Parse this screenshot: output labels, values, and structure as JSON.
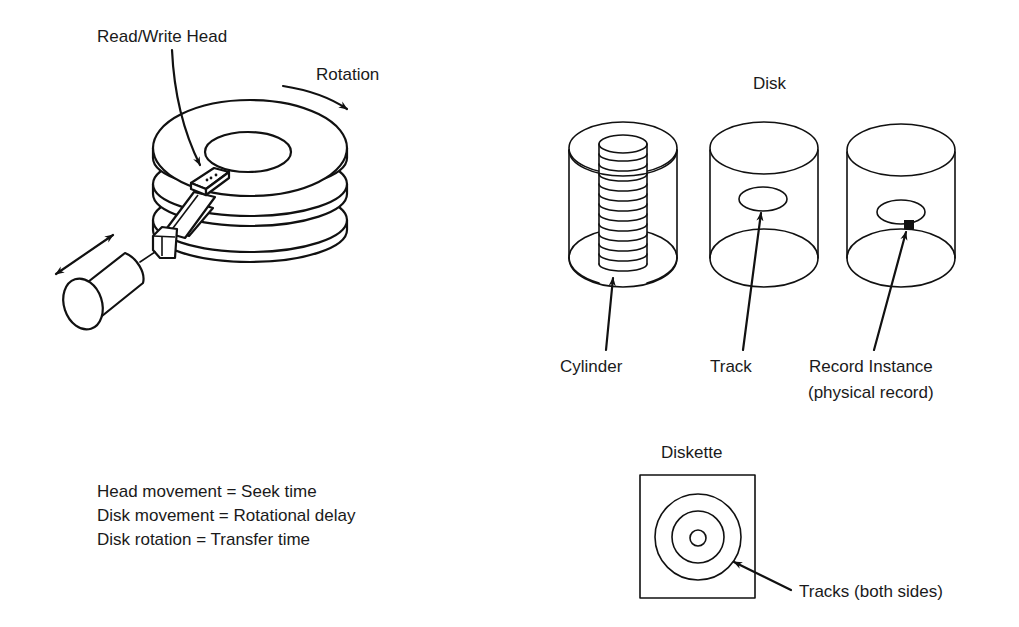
{
  "diagram": {
    "disk_drive": {
      "read_write_head_label": "Read/Write Head",
      "rotation_label": "Rotation"
    },
    "disk": {
      "title": "Disk",
      "parts": [
        {
          "label": "Cylinder"
        },
        {
          "label": "Track"
        },
        {
          "label": "Record Instance",
          "sublabel": "(physical record)"
        }
      ]
    },
    "timing_legend": [
      "Head movement = Seek time",
      "Disk movement = Rotational delay",
      "Disk rotation = Transfer time"
    ],
    "diskette": {
      "title": "Diskette",
      "tracks_label": "Tracks (both sides)"
    },
    "colors": {
      "line": "#111111",
      "background": "#ffffff"
    }
  }
}
